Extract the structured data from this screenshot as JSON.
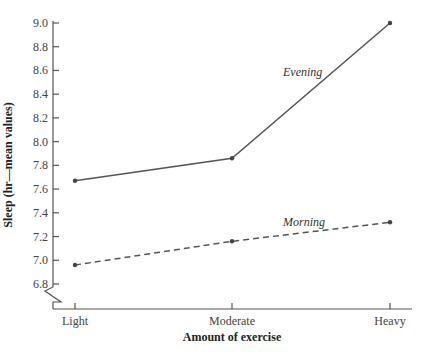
{
  "chart_data": {
    "type": "line",
    "title": "",
    "xlabel": "Amount of exercise",
    "ylabel": "Sleep (hr—mean values)",
    "categories": [
      "Light",
      "Moderate",
      "Heavy"
    ],
    "series": [
      {
        "name": "Evening",
        "style": "solid",
        "values": [
          7.67,
          7.86,
          9.0
        ]
      },
      {
        "name": "Morning",
        "style": "dashed",
        "values": [
          6.96,
          7.16,
          7.32
        ]
      }
    ],
    "yticks": [
      "6.8",
      "7.0",
      "7.2",
      "7.4",
      "7.6",
      "7.8",
      "8.0",
      "8.2",
      "8.4",
      "8.6",
      "8.8",
      "9.0"
    ],
    "ylim": [
      6.8,
      9.0
    ],
    "y_axis_break": true,
    "grid": false,
    "legend": "inline labels"
  },
  "colors": {
    "line": "#555555",
    "text": "#333333"
  }
}
